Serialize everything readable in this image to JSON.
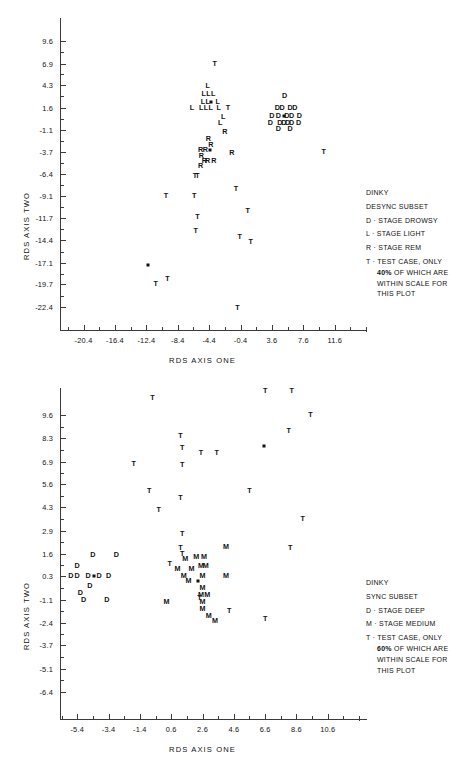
{
  "chart_data": [
    {
      "id": "top",
      "type": "scatter",
      "title": "DINKY",
      "subtitle": "DESYNC SUBSET",
      "xlabel": "RDS AXIS ONE",
      "ylabel": "RDS AXIS TWO",
      "xticks": [
        "-20.4",
        "-16.4",
        "-12.4",
        "-8.4",
        "-4.4",
        "-0.4",
        "3.6",
        "7.6",
        "11.6"
      ],
      "xtick_values": [
        -20.4,
        -16.4,
        -12.4,
        -8.4,
        -4.4,
        -0.4,
        3.6,
        7.6,
        11.6
      ],
      "yticks": [
        "9.6",
        "6.9",
        "4.3",
        "1.6",
        "-1.1",
        "-3.7",
        "-6.4",
        "-9.1",
        "-11.7",
        "-14.4",
        "-17.1",
        "-19.7",
        "-22.4"
      ],
      "ytick_values": [
        9.6,
        6.9,
        4.3,
        1.6,
        -1.1,
        -3.7,
        -6.4,
        -9.1,
        -11.7,
        -14.4,
        -17.1,
        -19.7,
        -22.4
      ],
      "xlim": [
        -23.4,
        12.9
      ],
      "ylim": [
        -24.0,
        11.2
      ],
      "grid": false,
      "legend_position": "right",
      "legend": [
        {
          "symbol": "",
          "label": "DINKY"
        },
        {
          "symbol": "",
          "label": "DESYNC SUBSET"
        },
        {
          "symbol": "D",
          "label": "STAGE DROWSY"
        },
        {
          "symbol": "L",
          "label": "STAGE LIGHT"
        },
        {
          "symbol": "R",
          "label": "STAGE REM"
        },
        {
          "symbol": "T",
          "label": "TEST CASE, ONLY"
        }
      ],
      "legend_note": [
        "40% OF WHICH ARE",
        "WITHIN SCALE FOR",
        "THIS PLOT"
      ],
      "legend_note_pct": "40%",
      "series": [
        {
          "name": "STAGE LIGHT",
          "symbol": "L",
          "points": [
            [
              -4.6,
              4.2
            ],
            [
              -5.1,
              3.2
            ],
            [
              -4.5,
              3.2
            ],
            [
              -3.9,
              3.2
            ],
            [
              -5.2,
              2.3
            ],
            [
              -4.6,
              2.3
            ],
            [
              -3.3,
              2.3
            ],
            [
              -6.6,
              1.6
            ],
            [
              -5.4,
              1.6
            ],
            [
              -4.8,
              1.6
            ],
            [
              -4.2,
              1.6
            ],
            [
              -3.2,
              1.6
            ],
            [
              -2.6,
              0.5
            ],
            [
              -3.0,
              -0.3
            ]
          ]
        },
        {
          "name": "STAGE DROWSY",
          "symbol": "D",
          "points": [
            [
              5.2,
              3.0
            ],
            [
              4.3,
              1.5
            ],
            [
              4.9,
              1.5
            ],
            [
              5.9,
              1.5
            ],
            [
              6.5,
              1.5
            ],
            [
              3.6,
              0.6
            ],
            [
              4.4,
              0.6
            ],
            [
              5.5,
              0.6
            ],
            [
              6.1,
              0.6
            ],
            [
              7.1,
              0.6
            ],
            [
              3.4,
              -0.2
            ],
            [
              4.6,
              -0.2
            ],
            [
              5.1,
              -0.2
            ],
            [
              5.6,
              -0.2
            ],
            [
              6.1,
              -0.2
            ],
            [
              7.0,
              -0.2
            ],
            [
              4.4,
              -1.0
            ],
            [
              5.9,
              -1.0
            ]
          ]
        },
        {
          "name": "STAGE REM",
          "symbol": "R",
          "points": [
            [
              -4.5,
              -2.2
            ],
            [
              -4.2,
              -2.9
            ],
            [
              -2.4,
              -1.3
            ],
            [
              -5.5,
              -3.5
            ],
            [
              -4.9,
              -3.5
            ],
            [
              -5.4,
              -4.2
            ],
            [
              -5.0,
              -4.8
            ],
            [
              -4.6,
              -4.8
            ],
            [
              -3.8,
              -4.8
            ],
            [
              -5.5,
              -5.4
            ],
            [
              -1.5,
              -3.9
            ]
          ]
        },
        {
          "name": "TEST CASE",
          "symbol": "T",
          "points": [
            [
              -3.7,
              6.9
            ],
            [
              -2.0,
              1.5
            ],
            [
              -6.2,
              -6.6
            ],
            [
              -5.9,
              -6.6
            ],
            [
              -9.9,
              -9.0
            ],
            [
              -6.3,
              -9.0
            ],
            [
              -1.0,
              -8.2
            ],
            [
              -5.9,
              -11.6
            ],
            [
              0.5,
              -10.9
            ],
            [
              -6.1,
              -13.3
            ],
            [
              -0.5,
              -14.0
            ],
            [
              0.9,
              -14.6
            ],
            [
              10.2,
              -3.8
            ],
            [
              -11.2,
              -19.6
            ],
            [
              -9.7,
              -19.1
            ],
            [
              -0.8,
              -22.6
            ]
          ]
        },
        {
          "name": "OVERPLOT MARKER",
          "symbol": "SQUARE",
          "points": [
            [
              -4.2,
              2.3
            ],
            [
              5.1,
              0.6
            ],
            [
              -4.3,
              -3.5
            ],
            [
              -12.2,
              -17.4
            ]
          ]
        }
      ]
    },
    {
      "id": "bottom",
      "type": "scatter",
      "title": "DINKY",
      "subtitle": "SYNC SUBSET",
      "xlabel": "RDS AXIS ONE",
      "ylabel": "RDS AXIS TWO",
      "xticks": [
        "-5.4",
        "-3.4",
        "-1.4",
        "0.6",
        "2.6",
        "4.6",
        "6.6",
        "8.6",
        "10.6"
      ],
      "xtick_values": [
        -5.4,
        -3.4,
        -1.4,
        0.6,
        2.6,
        4.6,
        6.6,
        8.6,
        10.6
      ],
      "yticks": [
        "9.6",
        "8.3",
        "6.9",
        "5.6",
        "4.3",
        "2.9",
        "1.6",
        "0.3",
        "-1.1",
        "-2.4",
        "-3.7",
        "-5.1",
        "-6.4"
      ],
      "ytick_values": [
        9.6,
        8.3,
        6.9,
        5.6,
        4.3,
        2.9,
        1.6,
        0.3,
        -1.1,
        -2.4,
        -3.7,
        -5.1,
        -6.4
      ],
      "xlim": [
        -6.5,
        11.7
      ],
      "ylim": [
        -7.4,
        10.6
      ],
      "grid": false,
      "legend_position": "right",
      "legend": [
        {
          "symbol": "",
          "label": "DINKY"
        },
        {
          "symbol": "",
          "label": "SYNC SUBSET"
        },
        {
          "symbol": "D",
          "label": "STAGE DEEP"
        },
        {
          "symbol": "M",
          "label": "STAGE MEDIUM"
        },
        {
          "symbol": "T",
          "label": "TEST CASE, ONLY"
        }
      ],
      "legend_note": [
        "60% OF WHICH ARE",
        "WITHIN SCALE FOR",
        "THIS PLOT"
      ],
      "legend_note_pct": "60%",
      "series": [
        {
          "name": "STAGE DEEP",
          "symbol": "D",
          "points": [
            [
              -4.4,
              1.5
            ],
            [
              -2.9,
              1.5
            ],
            [
              -5.4,
              0.9
            ],
            [
              -5.8,
              0.3
            ],
            [
              -5.4,
              0.3
            ],
            [
              -4.7,
              0.3
            ],
            [
              -4.0,
              0.3
            ],
            [
              -3.4,
              0.3
            ],
            [
              -4.6,
              -0.3
            ],
            [
              -5.2,
              -0.7
            ],
            [
              -5.0,
              -1.1
            ],
            [
              -3.5,
              -1.1
            ]
          ]
        },
        {
          "name": "STAGE MEDIUM",
          "symbol": "M",
          "points": [
            [
              1.5,
              1.3
            ],
            [
              2.2,
              1.4
            ],
            [
              2.7,
              1.4
            ],
            [
              4.1,
              2.0
            ],
            [
              2.5,
              0.9
            ],
            [
              2.8,
              0.9
            ],
            [
              1.0,
              0.7
            ],
            [
              1.9,
              0.7
            ],
            [
              1.4,
              0.3
            ],
            [
              2.6,
              0.3
            ],
            [
              4.1,
              0.3
            ],
            [
              1.7,
              0.0
            ],
            [
              2.6,
              -0.4
            ],
            [
              2.5,
              -0.8
            ],
            [
              2.9,
              -0.8
            ],
            [
              0.3,
              -1.2
            ],
            [
              2.6,
              -1.2
            ],
            [
              2.6,
              -1.6
            ],
            [
              3.0,
              -2.0
            ],
            [
              3.4,
              -2.3
            ]
          ]
        },
        {
          "name": "TEST CASE",
          "symbol": "T",
          "points": [
            [
              1.3,
              2.7
            ],
            [
              1.2,
              1.9
            ],
            [
              1.3,
              1.6
            ],
            [
              0.5,
              1.0
            ],
            [
              -0.8,
              5.2
            ],
            [
              1.2,
              4.8
            ],
            [
              -1.8,
              6.8
            ],
            [
              1.3,
              6.7
            ],
            [
              1.2,
              8.4
            ],
            [
              1.3,
              7.7
            ],
            [
              2.5,
              7.4
            ],
            [
              3.5,
              7.4
            ],
            [
              5.6,
              5.2
            ],
            [
              8.1,
              8.7
            ],
            [
              9.5,
              9.6
            ],
            [
              -0.2,
              4.1
            ],
            [
              9.0,
              3.6
            ],
            [
              8.2,
              1.9
            ],
            [
              2.4,
              -1.0
            ],
            [
              4.3,
              -1.7
            ],
            [
              6.6,
              -2.2
            ],
            [
              -0.6,
              10.6
            ],
            [
              6.6,
              11.0
            ],
            [
              8.3,
              11.0
            ]
          ]
        },
        {
          "name": "OVERPLOT MARKER",
          "symbol": "SQUARE",
          "points": [
            [
              -4.3,
              0.3
            ],
            [
              2.3,
              0.0
            ],
            [
              6.5,
              7.8
            ]
          ]
        }
      ]
    }
  ]
}
